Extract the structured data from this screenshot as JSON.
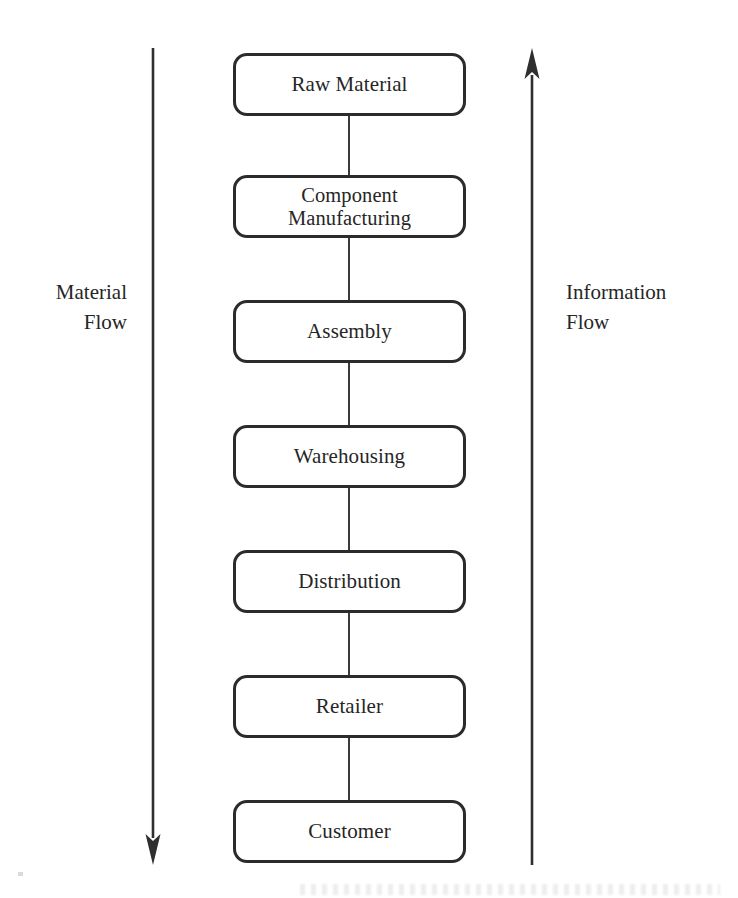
{
  "diagram": {
    "type": "supply-chain-flow",
    "title": "",
    "stroke_color": "#2b2b2b",
    "connector_color": "#3a3a3a",
    "background_color": "#ffffff",
    "nodes": [
      {
        "id": "raw-material",
        "label": "Raw Material",
        "top": 53,
        "lines": 1
      },
      {
        "id": "component-manufacturing",
        "label": "Component\nManufacturing",
        "top": 175,
        "lines": 2
      },
      {
        "id": "assembly",
        "label": "Assembly",
        "top": 300,
        "lines": 1
      },
      {
        "id": "warehousing",
        "label": "Warehousing",
        "top": 425,
        "lines": 1
      },
      {
        "id": "distribution",
        "label": "Distribution",
        "top": 550,
        "lines": 1
      },
      {
        "id": "retailer",
        "label": "Retailer",
        "top": 675,
        "lines": 1
      },
      {
        "id": "customer",
        "label": "Customer",
        "top": 800,
        "lines": 1
      }
    ],
    "connectors": [
      {
        "from": "raw-material",
        "to": "component-manufacturing",
        "top": 116,
        "height": 59
      },
      {
        "from": "component-manufacturing",
        "to": "assembly",
        "top": 238,
        "height": 62
      },
      {
        "from": "assembly",
        "to": "warehousing",
        "top": 363,
        "height": 62
      },
      {
        "from": "warehousing",
        "to": "distribution",
        "top": 488,
        "height": 62
      },
      {
        "from": "distribution",
        "to": "retailer",
        "top": 613,
        "height": 62
      },
      {
        "from": "retailer",
        "to": "customer",
        "top": 738,
        "height": 62
      }
    ],
    "flows": [
      {
        "id": "material-flow",
        "label": "Material\nFlow",
        "direction": "down",
        "side": "left",
        "from_node": "raw-material",
        "to_node": "customer"
      },
      {
        "id": "information-flow",
        "label": "Information\nFlow",
        "direction": "up",
        "side": "right",
        "from_node": "customer",
        "to_node": "raw-material"
      }
    ]
  }
}
